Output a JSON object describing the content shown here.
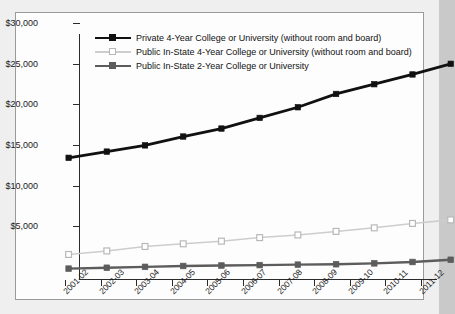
{
  "chart_data": {
    "type": "line",
    "title": "",
    "xlabel": "",
    "ylabel": "",
    "ylim": [
      0,
      30000
    ],
    "ytick_values": [
      30000,
      25000,
      20000,
      15000,
      10000,
      5000
    ],
    "ytick_labels": [
      "$30,000",
      "$25,000",
      "$20,000",
      "$15,000",
      "$10,000",
      "$5,000"
    ],
    "grid": false,
    "legend_position": "top-left-inside",
    "categories": [
      "2001-02",
      "2002-03",
      "2003-04",
      "2004-05",
      "2005-06",
      "2006-07",
      "2007-08",
      "2008-09",
      "2009-10",
      "2010-11",
      "2011-12"
    ],
    "series": [
      {
        "name": "Private 4-Year College or University (without room and board)",
        "color": "#111111",
        "marker": "filled-square",
        "values": [
          14900,
          15600,
          16300,
          17300,
          18200,
          19400,
          20600,
          22100,
          23200,
          24300,
          25500
        ]
      },
      {
        "name": "Public In-State 4-Year College or University (without room and board)",
        "color": "#cdcdcd",
        "marker": "open-square",
        "values": [
          4000,
          4400,
          4900,
          5200,
          5500,
          5900,
          6200,
          6600,
          7000,
          7500,
          7900
        ]
      },
      {
        "name": "Public In-State 2-Year College or University",
        "color": "#5c5c5c",
        "marker": "filled-square",
        "values": [
          2400,
          2500,
          2600,
          2700,
          2750,
          2800,
          2850,
          2900,
          3000,
          3150,
          3400
        ]
      }
    ]
  },
  "colors": {
    "figure_background": "#efefef",
    "plot_background": "#fdfdfd",
    "frame_border": "#9a9a9a",
    "axis": "#2b2b2b",
    "series_1": "#111111",
    "series_2": "#cdcdcd",
    "series_3": "#5c5c5c"
  }
}
